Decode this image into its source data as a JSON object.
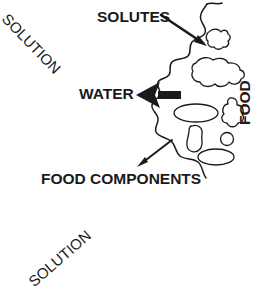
{
  "figure": {
    "background_color": "#ffffff",
    "ink_color": "#1a1a1a",
    "width": 268,
    "height": 289
  },
  "labels": {
    "solutes": "SOLUTES",
    "water": "WATER",
    "food_components": "FOOD COMPONENTS",
    "food": "FOOD",
    "solution_top": "SOLUTION",
    "solution_bottom": "SOLUTION"
  },
  "annotations": {
    "solutes_arrow": "thin-arrow-pointing-down-right-into-food",
    "water_arrow": "thick-block-arrow-pointing-left-out-of-food",
    "food_components_arrow": "thin-arrow-pointing-down-left-out-of-food"
  },
  "regions": {
    "left": "SOLUTION",
    "right": "FOOD",
    "boundary": "wavy-membrane-line"
  },
  "food_particles": [
    {
      "name": "irregular-blob-upper",
      "shape": "irregular"
    },
    {
      "name": "irregular-blob-mid",
      "shape": "amoeba"
    },
    {
      "name": "ellipse-blob-mid",
      "shape": "ellipse"
    },
    {
      "name": "bean-blob-lower",
      "shape": "bean"
    },
    {
      "name": "small-circle-blob",
      "shape": "circle"
    },
    {
      "name": "ellipse-blob-lower",
      "shape": "ellipse"
    },
    {
      "name": "irregular-blob-right",
      "shape": "irregular"
    }
  ]
}
